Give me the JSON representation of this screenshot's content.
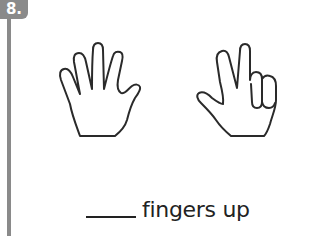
{
  "question": {
    "number_label": "8.",
    "badge_color": "#8a8a8a",
    "hands": [
      {
        "side": "left",
        "description": "open hand, all fingers up",
        "fingers_up": 5
      },
      {
        "side": "right",
        "description": "index and middle fingers up with thumb out, ring and pinky folded",
        "fingers_up": 3
      }
    ],
    "answer_blank": "____",
    "caption": "fingers up"
  }
}
